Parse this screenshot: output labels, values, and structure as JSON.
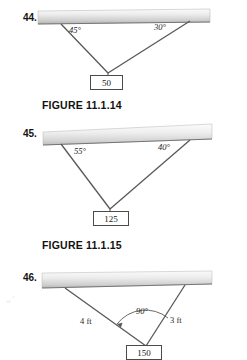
{
  "page": {
    "background": "#ffffff",
    "ink": "#1a1a1a",
    "bar_light": "#f2f2f2",
    "bar_dark": "#b9b9b9",
    "line_color": "#4a4a4a"
  },
  "figures": [
    {
      "number": "44.",
      "caption": "FIGURE 11.1.14",
      "weight_label": "50",
      "angles": [
        {
          "label": "45°",
          "side": "left"
        },
        {
          "label": "30°",
          "side": "right"
        }
      ],
      "lengths": []
    },
    {
      "number": "45.",
      "caption": "FIGURE 11.1.15",
      "weight_label": "125",
      "angles": [
        {
          "label": "55°",
          "side": "left"
        },
        {
          "label": "40°",
          "side": "right"
        }
      ],
      "lengths": []
    },
    {
      "number": "46.",
      "caption": "",
      "weight_label": "150",
      "angles": [
        {
          "label": "90°",
          "side": "apex"
        }
      ],
      "lengths": [
        {
          "label": "4 ft",
          "side": "left"
        },
        {
          "label": "3 ft",
          "side": "right"
        }
      ]
    }
  ]
}
